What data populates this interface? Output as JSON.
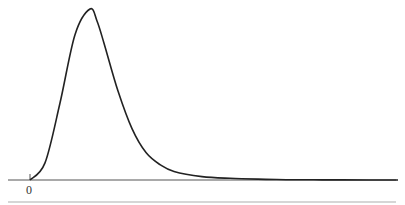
{
  "chart_data": {
    "type": "line",
    "title": "",
    "xlabel": "",
    "ylabel": "",
    "x_tick_labels": [
      "0"
    ],
    "grid": false,
    "legend": null,
    "series": [
      {
        "name": "density",
        "x": [
          0,
          0.25,
          0.5,
          0.75,
          1.0,
          1.25,
          1.5,
          2.0,
          2.5,
          3.0,
          3.5,
          4.0,
          5.0,
          6.0,
          7.0,
          8.0,
          9.0,
          10.0,
          12.0
        ],
        "y": [
          0,
          0.1,
          0.45,
          0.85,
          1.0,
          0.93,
          0.8,
          0.52,
          0.3,
          0.16,
          0.09,
          0.05,
          0.02,
          0.01,
          0.005,
          0.002,
          0.001,
          0.0005,
          0.0
        ]
      }
    ],
    "colors": {
      "curve": "#222222",
      "axis": "#555555",
      "rule": "#c8c8c8"
    }
  },
  "axis": {
    "origin_label": "0"
  }
}
